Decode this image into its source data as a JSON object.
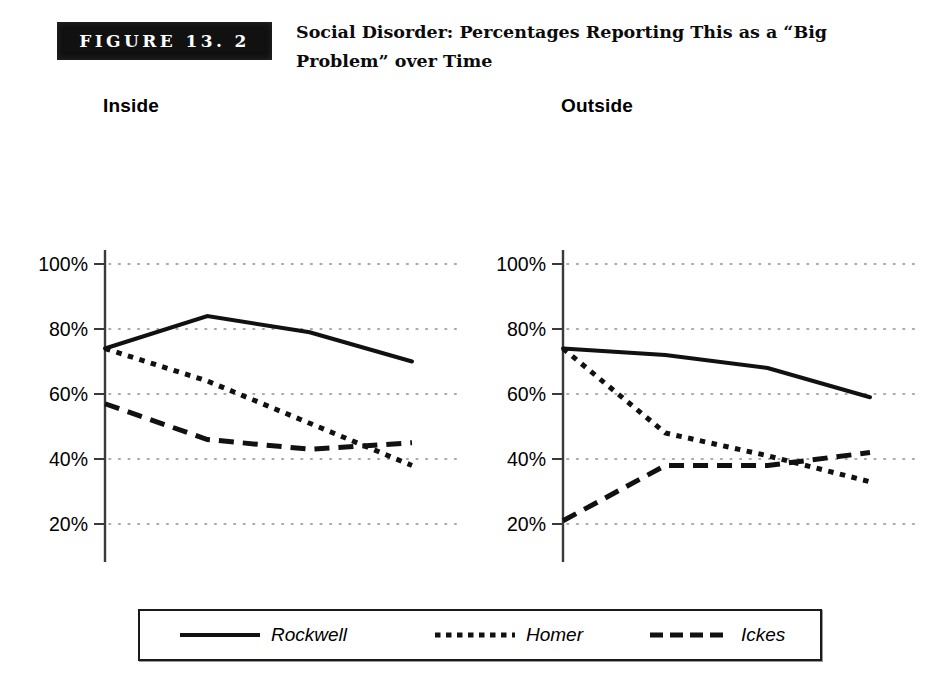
{
  "figure": {
    "badge_label": "FIGURE 13. 2",
    "title": "Social Disorder: Percentages Reporting This as a “Big Problem” over Time"
  },
  "legend": {
    "items": [
      {
        "label": "Rockwell",
        "style": "solid",
        "swatch_name": "legend-swatch-solid"
      },
      {
        "label": "Homer",
        "style": "dotted",
        "swatch_name": "legend-swatch-dotted"
      },
      {
        "label": "Ickes",
        "style": "dashed",
        "swatch_name": "legend-swatch-dashed"
      }
    ]
  },
  "colors": {
    "line": "#111111",
    "axis": "#3a3a3a",
    "grid": "#8e8e8e",
    "badge_bg": "#111111",
    "badge_text": "#ffffff"
  },
  "chart_data": [
    {
      "type": "line",
      "title": "Inside",
      "xlabel": "",
      "ylabel": "",
      "ylim": [
        0,
        100
      ],
      "yticks": [
        0,
        20,
        40,
        60,
        80,
        100
      ],
      "ytick_labels": [
        "0%",
        "20%",
        "40%",
        "60%",
        "80%",
        "100%"
      ],
      "categories": [
        "May 1994",
        "Jan 1995",
        "May 1995",
        "Dec 1995"
      ],
      "xtick_labels": [
        [
          "May",
          "1994"
        ],
        [
          "Jan",
          "1995"
        ],
        [
          "May",
          "1995"
        ],
        [
          "Dec",
          "1995"
        ]
      ],
      "grid": true,
      "grid_axis": "y",
      "legend_position": "bottom-shared",
      "series": [
        {
          "name": "Rockwell",
          "style": "solid",
          "values": [
            74,
            84,
            79,
            70
          ]
        },
        {
          "name": "Homer",
          "style": "dotted",
          "values": [
            74,
            64,
            51,
            38
          ]
        },
        {
          "name": "Ickes",
          "style": "dashed",
          "values": [
            57,
            46,
            43,
            45
          ]
        }
      ]
    },
    {
      "type": "line",
      "title": "Outside",
      "xlabel": "",
      "ylabel": "",
      "ylim": [
        0,
        100
      ],
      "yticks": [
        0,
        20,
        40,
        60,
        80,
        100
      ],
      "ytick_labels": [
        "0%",
        "20%",
        "40%",
        "60%",
        "80%",
        "100%"
      ],
      "categories": [
        "May 1994",
        "Jan 1995",
        "May 1995",
        "Dec 1995"
      ],
      "xtick_labels": [
        [
          "May",
          "1994"
        ],
        [
          "Jan",
          "1995"
        ],
        [
          "May",
          "1995"
        ],
        [
          "Dec",
          "1995"
        ]
      ],
      "grid": true,
      "grid_axis": "y",
      "legend_position": "bottom-shared",
      "series": [
        {
          "name": "Rockwell",
          "style": "solid",
          "values": [
            74,
            72,
            68,
            59
          ]
        },
        {
          "name": "Homer",
          "style": "dotted",
          "values": [
            74,
            48,
            41,
            33
          ]
        },
        {
          "name": "Ickes",
          "style": "dashed",
          "values": [
            21,
            38,
            38,
            42
          ]
        }
      ]
    }
  ]
}
